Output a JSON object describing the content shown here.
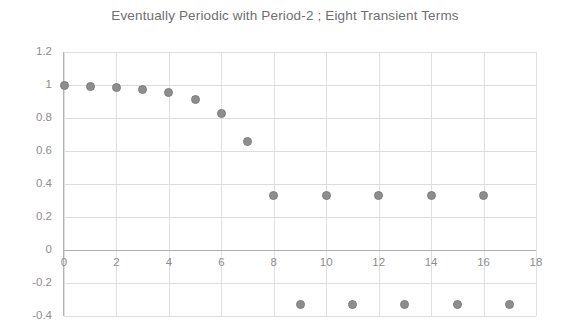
{
  "chart_data": {
    "type": "scatter",
    "title": "Eventually Periodic with Period-2 ; Eight Transient Terms",
    "xlabel": "",
    "ylabel": "",
    "xlim": [
      0,
      18
    ],
    "ylim": [
      -0.4,
      1.2
    ],
    "grid": true,
    "legend": false,
    "marker": "filled-circle",
    "marker_color": "#8d8d8d",
    "x_ticks": [
      0,
      2,
      4,
      6,
      8,
      10,
      12,
      14,
      16,
      18
    ],
    "x_tick_labels": [
      "0",
      "2",
      "4",
      "6",
      "8",
      "10",
      "12",
      "14",
      "16",
      "18"
    ],
    "y_ticks": [
      1.2,
      1,
      0.8,
      0.6,
      0.4,
      0.2,
      0,
      -0.2,
      -0.4
    ],
    "y_tick_labels": [
      "1.2",
      "1",
      "0.8",
      "0.6",
      "0.4",
      "0.2",
      "0",
      "-0.2",
      "-0.4"
    ],
    "x": [
      0,
      1,
      2,
      3,
      4,
      5,
      6,
      7,
      8,
      9,
      10,
      11,
      12,
      13,
      14,
      15,
      16,
      17
    ],
    "values": [
      1,
      0.99,
      0.985,
      0.975,
      0.955,
      0.91,
      0.83,
      0.66,
      0.33,
      -0.33,
      0.33,
      -0.33,
      0.33,
      -0.33,
      0.33,
      -0.33,
      0.33,
      -0.33
    ]
  },
  "colors": {
    "marker": "#8d8d8d",
    "marker_border": "#7e7e7e",
    "gridline": "#dcdcdc",
    "axis": "#b0b0b0",
    "text": "#8e8e8e",
    "title_text": "#6f6f6f",
    "background": "#ffffff"
  }
}
